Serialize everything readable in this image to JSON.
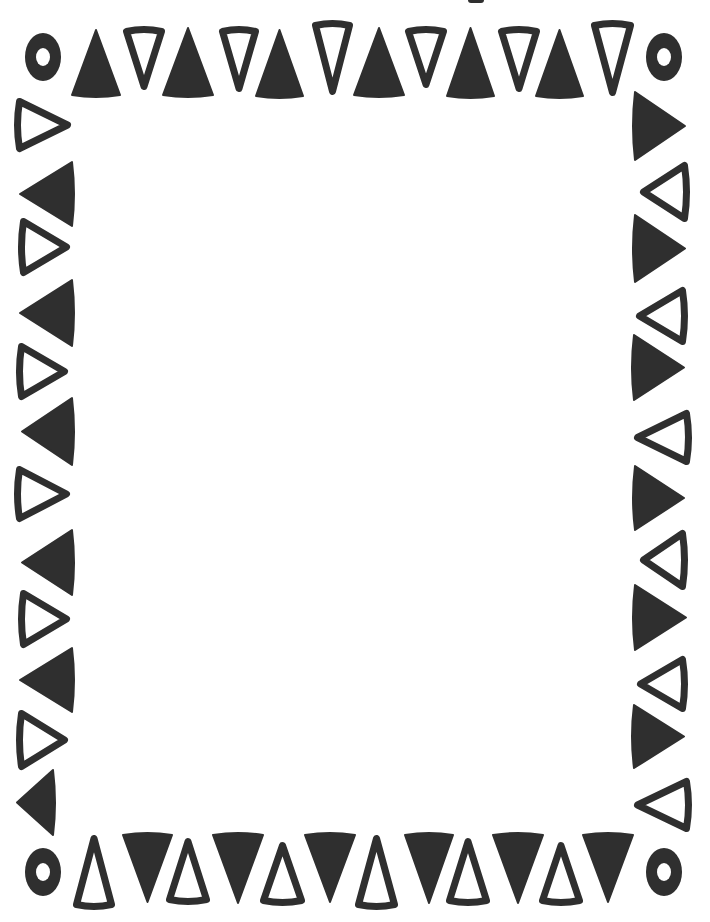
{
  "frame": {
    "name": "triangle-border-frame",
    "width": 710,
    "height": 922,
    "background_color": "#ffffff",
    "ink_color": "#2f2f2f",
    "outline_stroke_width": 7
  },
  "corners": [
    {
      "id": "top-left",
      "cx": 43,
      "cy": 57,
      "rx": 18,
      "ry": 24,
      "hole_rx": 7,
      "hole_ry": 9
    },
    {
      "id": "top-right",
      "cx": 664,
      "cy": 57,
      "rx": 18,
      "ry": 24,
      "hole_rx": 7,
      "hole_ry": 9
    },
    {
      "id": "bottom-left",
      "cx": 43,
      "cy": 872,
      "rx": 18,
      "ry": 24,
      "hole_rx": 7,
      "hole_ry": 9
    },
    {
      "id": "bottom-right",
      "cx": 664,
      "cy": 872,
      "rx": 18,
      "ry": 24,
      "hole_rx": 7,
      "hole_ry": 9
    }
  ],
  "top_row": [
    {
      "style": "filled",
      "dir": "up",
      "x1": 72,
      "x2": 120,
      "y1": 30,
      "y2": 95
    },
    {
      "style": "outline",
      "dir": "down",
      "x1": 123,
      "x2": 165,
      "y1": 28,
      "y2": 90
    },
    {
      "style": "filled",
      "dir": "up",
      "x1": 163,
      "x2": 213,
      "y1": 28,
      "y2": 95
    },
    {
      "style": "outline",
      "dir": "down",
      "x1": 219,
      "x2": 259,
      "y1": 28,
      "y2": 92
    },
    {
      "style": "filled",
      "dir": "up",
      "x1": 256,
      "x2": 303,
      "y1": 30,
      "y2": 96
    },
    {
      "style": "outline",
      "dir": "down",
      "x1": 312,
      "x2": 353,
      "y1": 22,
      "y2": 95
    },
    {
      "style": "filled",
      "dir": "up",
      "x1": 354,
      "x2": 404,
      "y1": 28,
      "y2": 95
    },
    {
      "style": "outline",
      "dir": "down",
      "x1": 405,
      "x2": 447,
      "y1": 28,
      "y2": 88
    },
    {
      "style": "filled",
      "dir": "up",
      "x1": 447,
      "x2": 494,
      "y1": 28,
      "y2": 96
    },
    {
      "style": "outline",
      "dir": "down",
      "x1": 498,
      "x2": 540,
      "y1": 28,
      "y2": 92
    },
    {
      "style": "filled",
      "dir": "up",
      "x1": 536,
      "x2": 583,
      "y1": 30,
      "y2": 96
    },
    {
      "style": "outline",
      "dir": "down",
      "x1": 591,
      "x2": 634,
      "y1": 22,
      "y2": 96
    }
  ],
  "bottom_row": [
    {
      "style": "outline",
      "dir": "up",
      "x1": 73,
      "x2": 115,
      "y1": 835,
      "y2": 908
    },
    {
      "style": "filled",
      "dir": "down",
      "x1": 123,
      "x2": 172,
      "y1": 835,
      "y2": 902
    },
    {
      "style": "outline",
      "dir": "up",
      "x1": 166,
      "x2": 210,
      "y1": 838,
      "y2": 903
    },
    {
      "style": "filled",
      "dir": "down",
      "x1": 213,
      "x2": 263,
      "y1": 835,
      "y2": 903
    },
    {
      "style": "outline",
      "dir": "up",
      "x1": 260,
      "x2": 305,
      "y1": 842,
      "y2": 904
    },
    {
      "style": "filled",
      "dir": "down",
      "x1": 305,
      "x2": 355,
      "y1": 835,
      "y2": 902
    },
    {
      "style": "outline",
      "dir": "up",
      "x1": 355,
      "x2": 398,
      "y1": 835,
      "y2": 908
    },
    {
      "style": "filled",
      "dir": "down",
      "x1": 405,
      "x2": 453,
      "y1": 835,
      "y2": 903
    },
    {
      "style": "outline",
      "dir": "up",
      "x1": 446,
      "x2": 490,
      "y1": 838,
      "y2": 904
    },
    {
      "style": "filled",
      "dir": "down",
      "x1": 493,
      "x2": 543,
      "y1": 835,
      "y2": 903
    },
    {
      "style": "outline",
      "dir": "up",
      "x1": 539,
      "x2": 583,
      "y1": 842,
      "y2": 904
    },
    {
      "style": "filled",
      "dir": "down",
      "x1": 583,
      "x2": 633,
      "y1": 835,
      "y2": 902
    }
  ],
  "left_column": [
    {
      "style": "outline",
      "dir": "right",
      "x1": 16,
      "x2": 71,
      "y1": 98,
      "y2": 152
    },
    {
      "style": "filled",
      "dir": "left",
      "x1": 20,
      "x2": 72,
      "y1": 162,
      "y2": 226
    },
    {
      "style": "outline",
      "dir": "right",
      "x1": 20,
      "x2": 70,
      "y1": 218,
      "y2": 276
    },
    {
      "style": "filled",
      "dir": "left",
      "x1": 20,
      "x2": 72,
      "y1": 280,
      "y2": 346
    },
    {
      "style": "outline",
      "dir": "right",
      "x1": 18,
      "x2": 68,
      "y1": 343,
      "y2": 400
    },
    {
      "style": "filled",
      "dir": "left",
      "x1": 22,
      "x2": 72,
      "y1": 398,
      "y2": 465
    },
    {
      "style": "outline",
      "dir": "right",
      "x1": 16,
      "x2": 70,
      "y1": 466,
      "y2": 522
    },
    {
      "style": "filled",
      "dir": "left",
      "x1": 22,
      "x2": 72,
      "y1": 530,
      "y2": 595
    },
    {
      "style": "outline",
      "dir": "right",
      "x1": 20,
      "x2": 70,
      "y1": 590,
      "y2": 648
    },
    {
      "style": "filled",
      "dir": "left",
      "x1": 20,
      "x2": 72,
      "y1": 648,
      "y2": 712
    },
    {
      "style": "outline",
      "dir": "right",
      "x1": 18,
      "x2": 68,
      "y1": 710,
      "y2": 770
    },
    {
      "style": "filled",
      "dir": "left",
      "x1": 17,
      "x2": 53,
      "y1": 770,
      "y2": 835
    }
  ],
  "right_column": [
    {
      "style": "filled",
      "dir": "right",
      "x1": 635,
      "x2": 685,
      "y1": 92,
      "y2": 160
    },
    {
      "style": "outline",
      "dir": "left",
      "x1": 640,
      "x2": 688,
      "y1": 162,
      "y2": 222
    },
    {
      "style": "filled",
      "dir": "right",
      "x1": 635,
      "x2": 685,
      "y1": 215,
      "y2": 282
    },
    {
      "style": "outline",
      "dir": "left",
      "x1": 636,
      "x2": 686,
      "y1": 287,
      "y2": 345
    },
    {
      "style": "filled",
      "dir": "right",
      "x1": 634,
      "x2": 684,
      "y1": 335,
      "y2": 400
    },
    {
      "style": "outline",
      "dir": "left",
      "x1": 634,
      "x2": 690,
      "y1": 410,
      "y2": 465
    },
    {
      "style": "filled",
      "dir": "right",
      "x1": 635,
      "x2": 684,
      "y1": 466,
      "y2": 530
    },
    {
      "style": "outline",
      "dir": "left",
      "x1": 640,
      "x2": 686,
      "y1": 530,
      "y2": 590
    },
    {
      "style": "filled",
      "dir": "right",
      "x1": 635,
      "x2": 686,
      "y1": 585,
      "y2": 650
    },
    {
      "style": "outline",
      "dir": "left",
      "x1": 637,
      "x2": 686,
      "y1": 656,
      "y2": 712
    },
    {
      "style": "filled",
      "dir": "right",
      "x1": 634,
      "x2": 684,
      "y1": 705,
      "y2": 768
    },
    {
      "style": "outline",
      "dir": "left",
      "x1": 634,
      "x2": 690,
      "y1": 778,
      "y2": 832
    }
  ],
  "content_area": {
    "label": "blank-writing-area"
  }
}
